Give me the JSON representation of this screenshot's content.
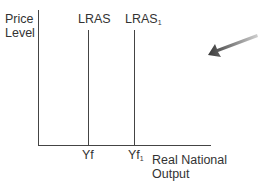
{
  "diagram": {
    "type": "economics-lras-shift",
    "y_axis_label": [
      "Price",
      "Level"
    ],
    "x_axis_label": [
      "Real National",
      "Output"
    ],
    "curves": [
      {
        "name": "LRAS",
        "sub": "",
        "x_tick": "Yf",
        "x_tick_sub": ""
      },
      {
        "name": "LRAS",
        "sub": "1",
        "x_tick": "Yf",
        "x_tick_sub": "1"
      }
    ],
    "arrow": {
      "direction": "left-down",
      "color": "#555555"
    },
    "colors": {
      "axis": "#333333",
      "line": "#444444"
    }
  }
}
